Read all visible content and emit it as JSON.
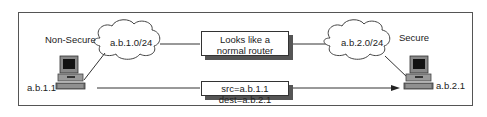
{
  "diagram": {
    "zones": {
      "non_secure": "Non-Secure",
      "secure": "Secure"
    },
    "networks": {
      "left": "a.b.1.0/24",
      "right": "a.b.2.0/24"
    },
    "hosts": {
      "left": "a.b.1.1",
      "right": "a.b.2.1"
    },
    "router_box": {
      "line1": "Looks like a",
      "line2": "normal router"
    },
    "packet_box": {
      "label": "src=a.b.1.1 dest=a.b.2.1"
    },
    "colors": {
      "line": "#333333",
      "shadow": "#555555",
      "cloud_fill": "#ffffff"
    }
  }
}
